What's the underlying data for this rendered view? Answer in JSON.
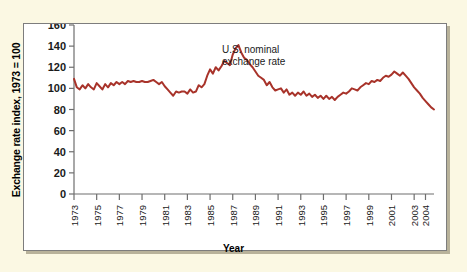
{
  "figure": {
    "background_color": "#fbf8e3",
    "panel_color": "#ffffff",
    "panel_border_color": "#7d7d7d"
  },
  "annotation": {
    "line1": "U.S. nominal",
    "line2": "exchange rate"
  },
  "chart_data": {
    "type": "line",
    "title": "",
    "xlabel": "Year",
    "ylabel": "Exchange rate index, 1973 = 100",
    "ylim": [
      0,
      160
    ],
    "xlim": [
      1973,
      2004.75
    ],
    "yticks": [
      0,
      20,
      40,
      60,
      80,
      100,
      120,
      140,
      160
    ],
    "xticks": [
      1973,
      1975,
      1977,
      1979,
      1981,
      1983,
      1985,
      1987,
      1989,
      1991,
      1993,
      1995,
      1997,
      1999,
      2001,
      2003,
      2004
    ],
    "xtick_labels": [
      "1973",
      "1975",
      "1977",
      "1979",
      "1981",
      "1983",
      "1985",
      "1987",
      "1989",
      "1991",
      "1993",
      "1995",
      "1997",
      "1999",
      "2001",
      "2003",
      "2004"
    ],
    "grid": false,
    "legend": "none",
    "line_color": "#a8332a",
    "line_width": 2.0,
    "series": [
      {
        "name": "U.S. nominal exchange rate",
        "x": [
          1973.0,
          1973.25,
          1973.5,
          1973.75,
          1974.0,
          1974.25,
          1974.5,
          1974.75,
          1975.0,
          1975.25,
          1975.5,
          1975.75,
          1976.0,
          1976.25,
          1976.5,
          1976.75,
          1977.0,
          1977.25,
          1977.5,
          1977.75,
          1978.0,
          1978.25,
          1978.5,
          1978.75,
          1979.0,
          1979.25,
          1979.5,
          1979.75,
          1980.0,
          1980.25,
          1980.5,
          1980.75,
          1981.0,
          1981.25,
          1981.5,
          1981.75,
          1982.0,
          1982.25,
          1982.5,
          1982.75,
          1983.0,
          1983.25,
          1983.5,
          1983.75,
          1984.0,
          1984.25,
          1984.5,
          1984.75,
          1985.0,
          1985.25,
          1985.5,
          1985.75,
          1986.0,
          1986.25,
          1986.5,
          1986.75,
          1987.0,
          1987.25,
          1987.5,
          1987.75,
          1988.0,
          1988.25,
          1988.5,
          1988.75,
          1989.0,
          1989.25,
          1989.5,
          1989.75,
          1990.0,
          1990.25,
          1990.5,
          1990.75,
          1991.0,
          1991.25,
          1991.5,
          1991.75,
          1992.0,
          1992.25,
          1992.5,
          1992.75,
          1993.0,
          1993.25,
          1993.5,
          1993.75,
          1994.0,
          1994.25,
          1994.5,
          1994.75,
          1995.0,
          1995.25,
          1995.5,
          1995.75,
          1996.0,
          1996.25,
          1996.5,
          1996.75,
          1997.0,
          1997.25,
          1997.5,
          1997.75,
          1998.0,
          1998.25,
          1998.5,
          1998.75,
          1999.0,
          1999.25,
          1999.5,
          1999.75,
          2000.0,
          2000.25,
          2000.5,
          2000.75,
          2001.0,
          2001.25,
          2001.5,
          2001.75,
          2002.0,
          2002.25,
          2002.5,
          2002.75,
          2003.0,
          2003.25,
          2003.5,
          2003.75,
          2004.0,
          2004.25,
          2004.5,
          2004.75
        ],
        "values": [
          109,
          101,
          99,
          103,
          100,
          104,
          101,
          99,
          105,
          102,
          99,
          104,
          101,
          105,
          103,
          106,
          104,
          106,
          104,
          107,
          106,
          107,
          106,
          106,
          107,
          106,
          106,
          107,
          108,
          106,
          104,
          106,
          102,
          99,
          96,
          93,
          97,
          96,
          97,
          97,
          95,
          99,
          96,
          97,
          103,
          101,
          104,
          112,
          118,
          114,
          120,
          117,
          121,
          126,
          124,
          122,
          132,
          138,
          141,
          134,
          129,
          127,
          123,
          120,
          116,
          112,
          110,
          108,
          103,
          106,
          101,
          98,
          99,
          100,
          96,
          99,
          94,
          96,
          93,
          96,
          94,
          97,
          93,
          95,
          92,
          94,
          91,
          93,
          90,
          93,
          90,
          92,
          89,
          92,
          94,
          96,
          95,
          97,
          100,
          99,
          98,
          101,
          103,
          105,
          104,
          107,
          106,
          108,
          107,
          110,
          112,
          111,
          113,
          116,
          114,
          112,
          115,
          112,
          109,
          105,
          101,
          98,
          95,
          91,
          88,
          85,
          82,
          80
        ]
      }
    ]
  }
}
